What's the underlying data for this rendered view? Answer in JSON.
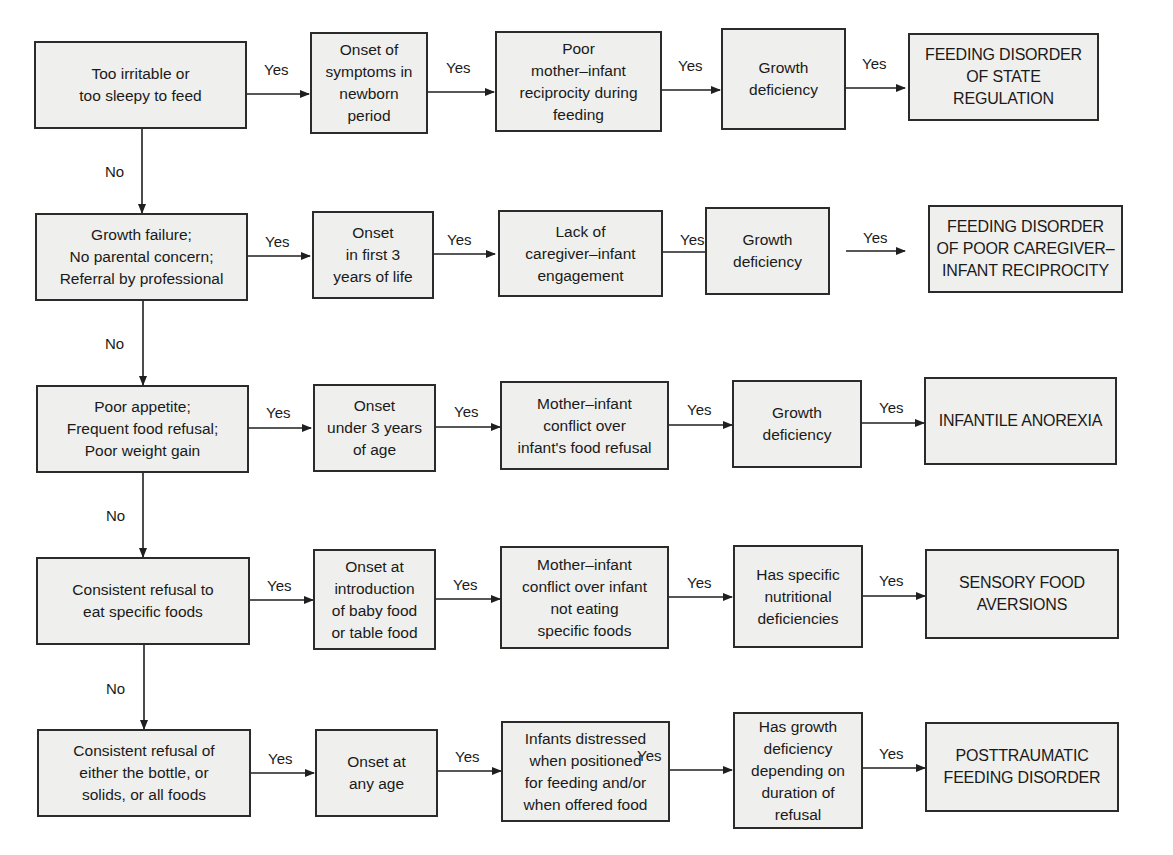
{
  "diagram": {
    "type": "flowchart",
    "yes_label": "Yes",
    "no_label": "No",
    "rows": [
      {
        "question": "Too irritable or\ntoo sleepy to feed",
        "onset": "Onset of\nsymptoms in\nnewborn\nperiod",
        "interaction": "Poor\nmother–infant\nreciprocity during\nfeeding",
        "growth": "Growth\ndeficiency",
        "diagnosis": "FEEDING DISORDER\nOF STATE REGULATION"
      },
      {
        "question": "Growth failure;\nNo parental concern;\nReferral by professional",
        "onset": "Onset\nin first 3\nyears of life",
        "interaction": "Lack of\ncaregiver–infant\nengagement",
        "growth": "Growth\ndeficiency",
        "diagnosis": "FEEDING DISORDER\nOF POOR CAREGIVER–\nINFANT RECIPROCITY"
      },
      {
        "question": "Poor appetite;\nFrequent food refusal;\nPoor weight gain",
        "onset": "Onset\nunder 3 years\nof age",
        "interaction": "Mother–infant\nconflict over\ninfant's food refusal",
        "growth": "Growth\ndeficiency",
        "diagnosis": "INFANTILE ANOREXIA"
      },
      {
        "question": "Consistent refusal to\neat specific foods",
        "onset": "Onset at\nintroduction\nof baby food\nor table food",
        "interaction": "Mother–infant\nconflict over infant\nnot eating\nspecific foods",
        "growth": "Has specific\nnutritional\ndeficiencies",
        "diagnosis": "SENSORY FOOD\nAVERSIONS"
      },
      {
        "question": "Consistent refusal of\neither the bottle, or\nsolids, or all foods",
        "onset": "Onset at\nany age",
        "interaction": "Infants distressed\nwhen positioned\nfor feeding and/or\nwhen offered food",
        "growth": "Has growth\ndeficiency\ndepending on\nduration of\nrefusal",
        "diagnosis": "POSTTRAUMATIC\nFEEDING DISORDER"
      }
    ]
  },
  "colors": {
    "box_fill": "#efefed",
    "box_border": "#2b2b2b",
    "line": "#1f1f1f",
    "text": "#1a1a1a",
    "background": "#ffffff"
  }
}
